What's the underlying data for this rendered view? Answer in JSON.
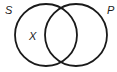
{
  "diagram": {
    "type": "venn",
    "sets": [
      {
        "label": "S",
        "cx": 46,
        "cy": 35,
        "r": 31
      },
      {
        "label": "P",
        "cx": 76,
        "cy": 35,
        "r": 31
      }
    ],
    "marks": [
      {
        "label": "X",
        "region": "S only"
      }
    ],
    "colors": {
      "stroke": "#1a1a1a",
      "background": "#ffffff"
    }
  }
}
